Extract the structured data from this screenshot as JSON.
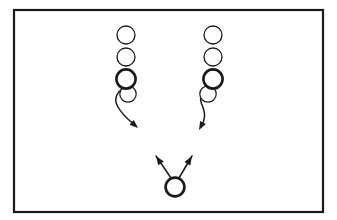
{
  "diagram": {
    "kind": "football-play-diagram",
    "width": 337,
    "height": 220,
    "background_color": "#ffffff",
    "ink_color": "#1a1a1a",
    "frame": {
      "label": "field-frame",
      "x": 14,
      "y": 10,
      "width": 309,
      "height": 202,
      "stroke_color": "#1a1a1a",
      "stroke_width": 2.2,
      "fill_color": "#ffffff"
    },
    "columns": [
      {
        "name": "left-column",
        "center_x": 126,
        "curl_direction": "right",
        "players": [
          {
            "name": "left-player-1",
            "cx": 126,
            "cy": 35,
            "r": 9.0,
            "stroke_width": 1.3,
            "weight": "thin"
          },
          {
            "name": "left-player-2",
            "cx": 126,
            "cy": 57,
            "r": 9.0,
            "stroke_width": 1.3,
            "weight": "thin"
          },
          {
            "name": "left-player-3",
            "cx": 126,
            "cy": 79,
            "r": 9.6,
            "stroke_width": 2.6,
            "weight": "thick"
          }
        ],
        "route": {
          "name": "left-curl-route",
          "stroke_width": 1.5,
          "loop_circle": {
            "cx": 128,
            "cy": 94,
            "r": 8.2,
            "stroke_width": 1.2
          },
          "path": "M 126 88 C 117 90 113 99 118 107 C 123 116 130 121 136 126",
          "arrow_tip": {
            "x": 138,
            "y": 128
          },
          "arrow_angle_deg": 42
        }
      },
      {
        "name": "right-column",
        "center_x": 213,
        "curl_direction": "left",
        "players": [
          {
            "name": "right-player-1",
            "cx": 213,
            "cy": 35,
            "r": 9.0,
            "stroke_width": 1.3,
            "weight": "thin"
          },
          {
            "name": "right-player-2",
            "cx": 213,
            "cy": 57,
            "r": 9.0,
            "stroke_width": 1.3,
            "weight": "thin"
          },
          {
            "name": "right-player-3",
            "cx": 213,
            "cy": 79,
            "r": 9.6,
            "stroke_width": 2.6,
            "weight": "thick"
          }
        ],
        "route": {
          "name": "right-curl-route",
          "stroke_width": 1.5,
          "loop_circle": {
            "cx": 208,
            "cy": 94,
            "r": 8.2,
            "stroke_width": 1.2
          },
          "path": "M 213 88 C 204 88 198 96 202 105 C 206 114 205 120 201 127",
          "arrow_tip": {
            "x": 199,
            "y": 130
          },
          "arrow_angle_deg": 118
        }
      }
    ],
    "ball_carrier": {
      "name": "quarterback-circle",
      "cx": 175,
      "cy": 187,
      "r": 9.4,
      "stroke_width": 2.7,
      "weight": "thick"
    },
    "split_arrows": [
      {
        "name": "split-arrow-left",
        "from": {
          "x": 171,
          "y": 178
        },
        "to": {
          "x": 156,
          "y": 156
        },
        "stroke_width": 1.5,
        "arrow_angle_deg": 236
      },
      {
        "name": "split-arrow-right",
        "from": {
          "x": 179,
          "y": 178
        },
        "to": {
          "x": 192,
          "y": 156
        },
        "stroke_width": 1.5,
        "arrow_angle_deg": 301
      }
    ]
  }
}
